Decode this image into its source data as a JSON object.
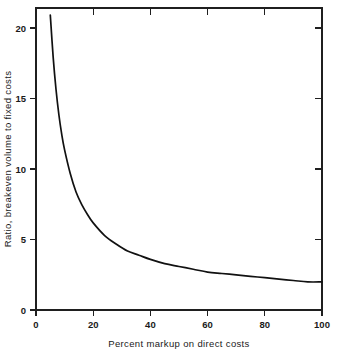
{
  "chart_data": {
    "type": "line",
    "title": "",
    "subtitle": "",
    "xlabel": "Percent markup on direct costs",
    "ylabel": "Ratio, breakeven volume to fixed costs",
    "xlim": [
      0,
      100
    ],
    "ylim": [
      0,
      21.5
    ],
    "xticks": [
      0,
      20,
      40,
      60,
      80,
      100
    ],
    "xtick_labels": [
      "0",
      "20",
      "40",
      "60",
      "80",
      "100"
    ],
    "yticks": [
      0,
      5,
      10,
      15,
      20
    ],
    "ytick_labels": [
      "0",
      "5",
      "10",
      "15",
      "20"
    ],
    "grid": false,
    "legend": null,
    "legend_position": "none",
    "annotations": [],
    "series": [
      {
        "name": "Breakeven volume ratio",
        "x": [
          5,
          6,
          7,
          8,
          9,
          10,
          12,
          14,
          16,
          18,
          20,
          24,
          28,
          32,
          36,
          40,
          45,
          50,
          55,
          60,
          65,
          70,
          75,
          80,
          85,
          90,
          95,
          100
        ],
        "values": [
          21.0,
          18.0,
          15.7,
          13.9,
          12.5,
          11.4,
          9.7,
          8.4,
          7.5,
          6.8,
          6.2,
          5.3,
          4.7,
          4.2,
          3.9,
          3.6,
          3.3,
          3.1,
          2.9,
          2.7,
          2.6,
          2.5,
          2.4,
          2.3,
          2.2,
          2.1,
          2.0,
          2.0
        ]
      }
    ]
  },
  "colors": {
    "background": "#ffffff",
    "axis": "#1f1f1f",
    "curve": "#111111",
    "text": "#1a1a1a"
  }
}
